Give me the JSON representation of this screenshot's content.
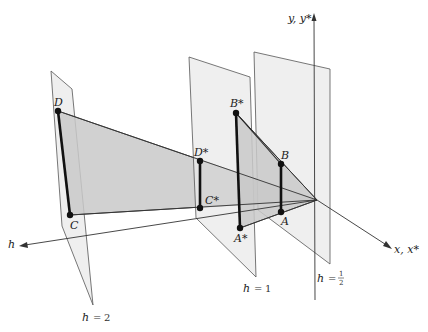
{
  "figure": {
    "type": "3D projective geometry diagram",
    "axes": {
      "vertical": "y, y*",
      "horizontal_right": "x, x*",
      "depth": "h"
    },
    "planes": [
      {
        "id": "h2",
        "label_var": "h",
        "label_eq": "=",
        "label_val": "2"
      },
      {
        "id": "h1",
        "label_var": "h",
        "label_eq": "=",
        "label_val": "1"
      },
      {
        "id": "hhalf",
        "label_var": "h",
        "label_eq": "=",
        "label_num": "1",
        "label_den": "2"
      }
    ],
    "points": [
      {
        "name": "D",
        "plane": "h = 2"
      },
      {
        "name": "C",
        "plane": "h = 2"
      },
      {
        "name": "D*",
        "plane": "h = 1"
      },
      {
        "name": "C*",
        "plane": "h = 1"
      },
      {
        "name": "B*",
        "plane": "h = 1"
      },
      {
        "name": "A*",
        "plane": "h = 1"
      },
      {
        "name": "B",
        "plane": "h = 1/2"
      },
      {
        "name": "A",
        "plane": "h = 1/2"
      }
    ],
    "segments": [
      "DC",
      "D*C*",
      "B*A*",
      "BA"
    ],
    "colors": {
      "plane_fill": "#e9e9e9",
      "shaded_fill": "#c9c9c9",
      "line": "#111111"
    }
  }
}
